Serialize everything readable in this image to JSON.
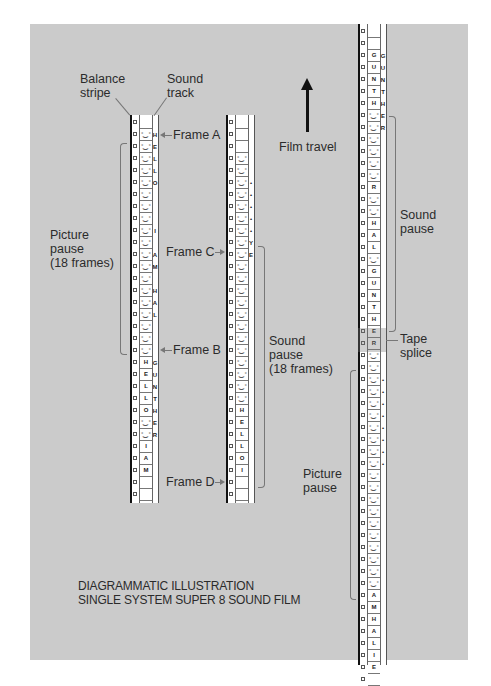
{
  "labels": {
    "balance_stripe": "Balance\nstripe",
    "sound_track": "Sound\ntrack",
    "frame_a": "Frame A",
    "frame_b": "Frame B",
    "frame_c": "Frame C",
    "frame_d": "Frame D",
    "picture_pause_18": "Picture\npause\n(18 frames)",
    "sound_pause_18": "Sound\npause\n(18 frames)",
    "film_travel": "Film travel",
    "sound_pause": "Sound\npause",
    "tape_splice": "Tape\nsplice",
    "picture_pause": "Picture\npause"
  },
  "caption": {
    "line1": "DIAGRAMMATIC ILLUSTRATION",
    "line2": "SINGLE SYSTEM SUPER 8 SOUND FILM"
  },
  "strips": [
    {
      "id": "strip-1",
      "frames": [
        "blank",
        "face",
        "face",
        "face",
        "face",
        "face",
        "face",
        "face",
        "face",
        "face",
        "face",
        "face",
        "face",
        "face",
        "face",
        "face",
        "face",
        "face",
        "face",
        "face",
        "H",
        "E",
        "L",
        "L",
        "O",
        "",
        "",
        "I",
        "A",
        "M",
        "blank",
        "blank"
      ],
      "track": [
        "",
        "H",
        "E",
        "L",
        "L",
        "O",
        "",
        "",
        "",
        "I",
        "",
        "A",
        "M",
        "",
        "H",
        "A",
        "L",
        "",
        "",
        "",
        "G",
        "U",
        "N",
        "T",
        "H",
        "E",
        "R",
        "",
        "",
        "",
        "",
        ""
      ]
    },
    {
      "id": "strip-2",
      "frames": [
        "blank",
        "blank",
        "blank",
        "face",
        "face",
        "face",
        "face",
        "face",
        "face",
        "face",
        "face",
        "face",
        "face",
        "face",
        "face",
        "face",
        "face",
        "face",
        "face",
        "face",
        "face",
        "face",
        "face",
        "face",
        "H",
        "E",
        "L",
        "L",
        "O",
        "I",
        "blank",
        "blank"
      ],
      "track": [
        "",
        "",
        "",
        "",
        "",
        "•",
        "•",
        "•",
        "•",
        "•",
        "Y",
        "E",
        "",
        "",
        "",
        "",
        "",
        "",
        "",
        "",
        "",
        "",
        "",
        "",
        "",
        "",
        "",
        "",
        "",
        "",
        "",
        ""
      ]
    },
    {
      "id": "strip-3",
      "frames": [
        "blank",
        "blank",
        "G",
        "U",
        "N",
        "T",
        "H",
        "face",
        "face",
        "face",
        "face",
        "face",
        "face",
        "R",
        "face",
        "face",
        "H",
        "A",
        "L",
        "face",
        "G",
        "U",
        "N",
        "T",
        "H",
        "E",
        "R",
        "face",
        "face",
        "face",
        "face",
        "face",
        "face",
        "face",
        "face",
        "face",
        "face",
        "face",
        "face",
        "face",
        "face",
        "face",
        "face",
        "face",
        "face",
        "face",
        "face",
        "A",
        "M",
        "H",
        "A",
        "L",
        "I",
        "E",
        "blank"
      ],
      "track": [
        "",
        "",
        "G",
        "U",
        "N",
        "T",
        "H",
        "E",
        "R",
        "",
        "",
        "",
        "",
        "",
        "",
        "",
        "",
        "",
        "",
        "",
        "",
        "",
        "",
        "",
        "",
        "",
        "",
        "",
        "",
        "•",
        "•",
        "•",
        "•",
        "•",
        "•",
        "•",
        "•",
        "",
        "",
        "",
        "",
        "",
        "",
        "",
        "",
        "",
        "",
        "",
        "",
        "",
        "",
        "",
        "",
        "",
        ""
      ]
    }
  ],
  "colors": {
    "panel": "#cbcbcb",
    "page": "#ffffff",
    "ink": "#2b2b2b"
  }
}
